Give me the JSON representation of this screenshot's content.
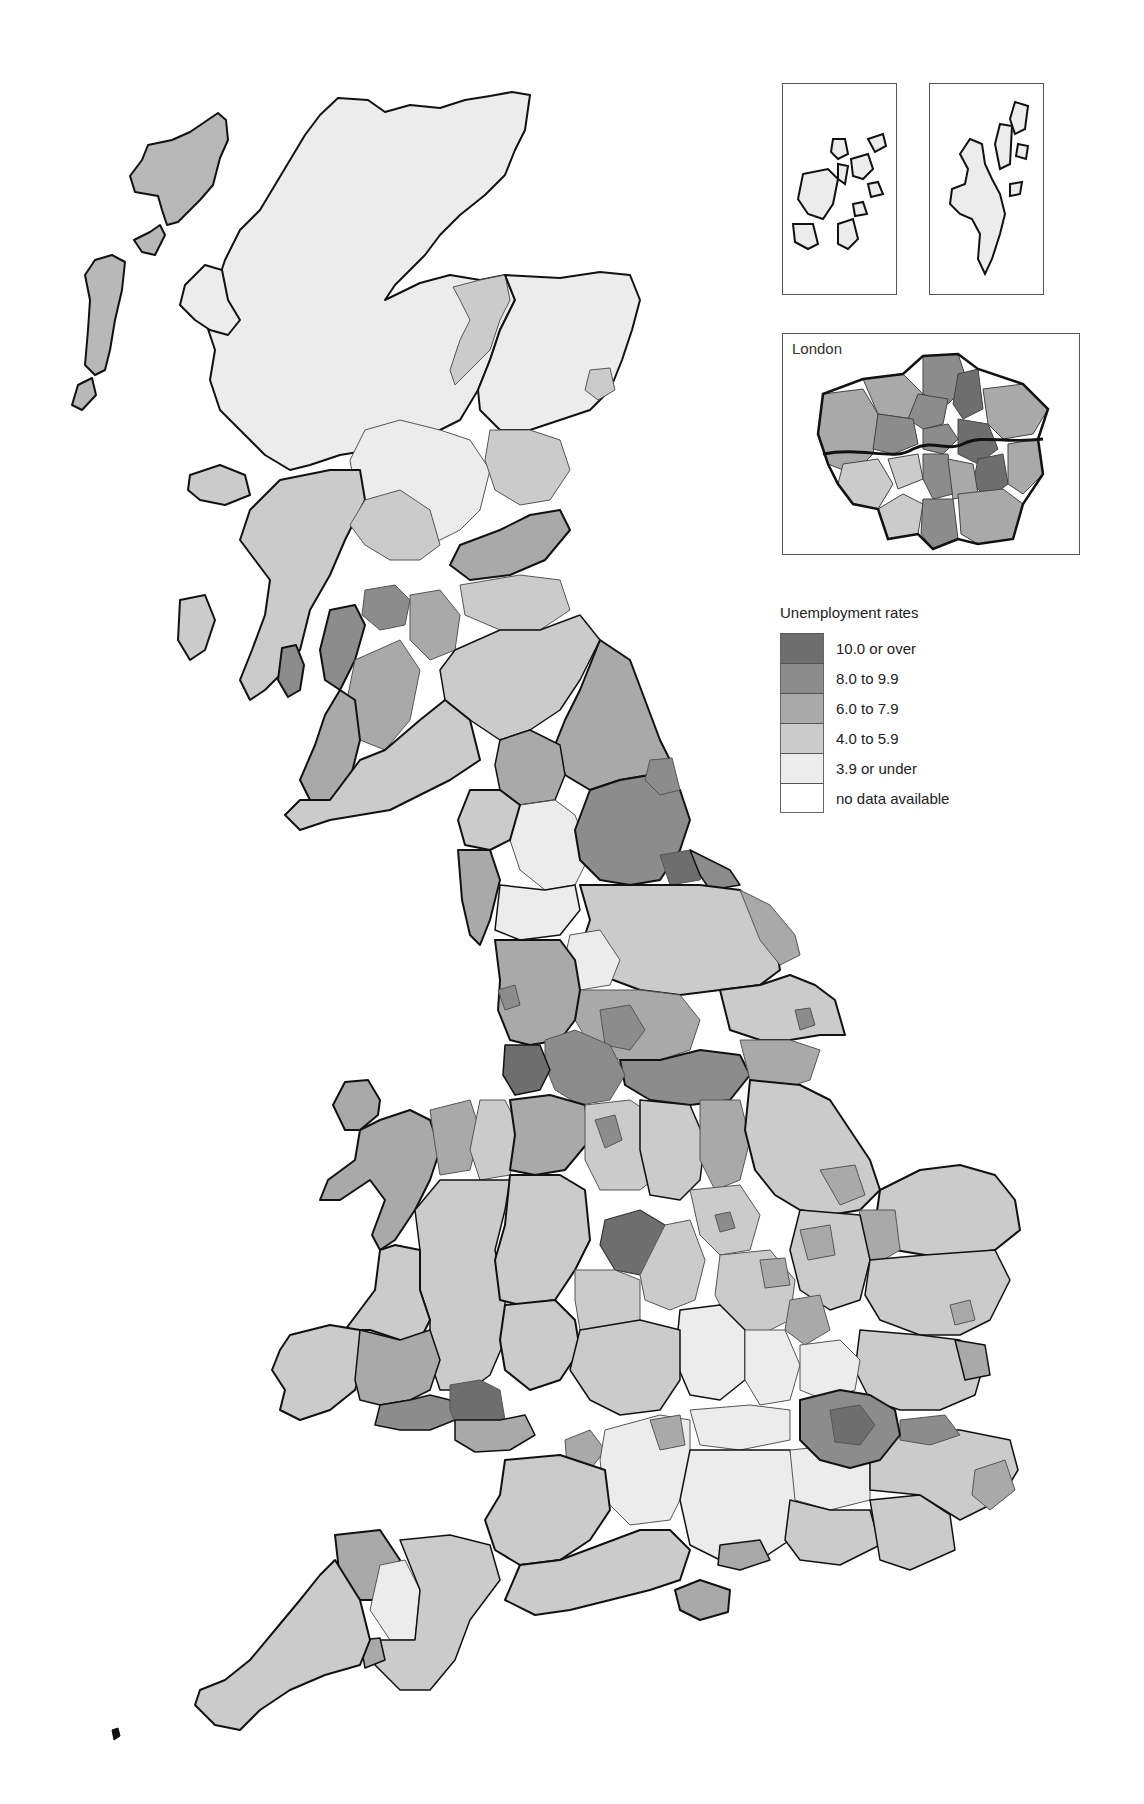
{
  "map": {
    "subject": "Unemployment rates by local area, Great Britain",
    "insets": {
      "orkney": {
        "title": ""
      },
      "shetland": {
        "title": ""
      },
      "london": {
        "title": "London"
      }
    }
  },
  "legend": {
    "title": "Unemployment rates",
    "items": [
      {
        "label": "10.0 or over",
        "color": "#6e6e6e"
      },
      {
        "label": "8.0 to 9.9",
        "color": "#8c8c8c"
      },
      {
        "label": "6.0 to 7.9",
        "color": "#a9a9a9"
      },
      {
        "label": "4.0 to 5.9",
        "color": "#cbcbcb"
      },
      {
        "label": "3.9 or under",
        "color": "#ececec"
      },
      {
        "label": "no data available",
        "color": "#ffffff"
      }
    ]
  },
  "colors": {
    "outline": "#111111",
    "inner_border": "#555555",
    "background": "#ffffff"
  }
}
